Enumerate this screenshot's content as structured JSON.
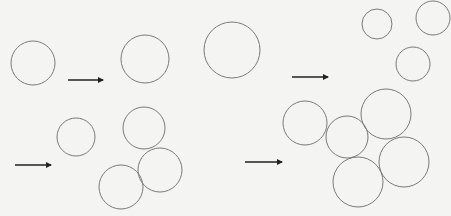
{
  "diagram": {
    "stroke_color": "#7a7a7a",
    "arrow_color": "#222222",
    "panels": [
      {
        "name": "top-left",
        "before": [
          {
            "cx": 33,
            "cy": 63,
            "r": 22
          }
        ],
        "arrow": {
          "x1": 68,
          "y1": 80,
          "x2": 107,
          "y2": 80
        },
        "after": [
          {
            "cx": 145,
            "cy": 59,
            "r": 24
          }
        ]
      },
      {
        "name": "top-right",
        "before": [
          {
            "cx": 232,
            "cy": 50,
            "r": 28
          }
        ],
        "arrow": {
          "x1": 292,
          "y1": 77,
          "x2": 332,
          "y2": 77
        },
        "after": [
          {
            "cx": 377,
            "cy": 24,
            "r": 15
          },
          {
            "cx": 433,
            "cy": 18,
            "r": 17
          },
          {
            "cx": 413,
            "cy": 64,
            "r": 17
          }
        ]
      },
      {
        "name": "bottom-left",
        "before": [
          {
            "cx": 76,
            "cy": 137,
            "r": 19
          }
        ],
        "arrow": {
          "x1": 15,
          "y1": 165,
          "x2": 55,
          "y2": 165
        },
        "after": [
          {
            "cx": 144,
            "cy": 128,
            "r": 21
          },
          {
            "cx": 160,
            "cy": 170,
            "r": 22
          },
          {
            "cx": 121,
            "cy": 187,
            "r": 22
          }
        ]
      },
      {
        "name": "bottom-right",
        "arrow": {
          "x1": 245,
          "y1": 162,
          "x2": 286,
          "y2": 162
        },
        "after": [
          {
            "cx": 305,
            "cy": 123,
            "r": 22
          },
          {
            "cx": 347,
            "cy": 137,
            "r": 21
          },
          {
            "cx": 386,
            "cy": 114,
            "r": 25
          },
          {
            "cx": 404,
            "cy": 162,
            "r": 25
          },
          {
            "cx": 358,
            "cy": 182,
            "r": 25
          }
        ]
      }
    ]
  }
}
